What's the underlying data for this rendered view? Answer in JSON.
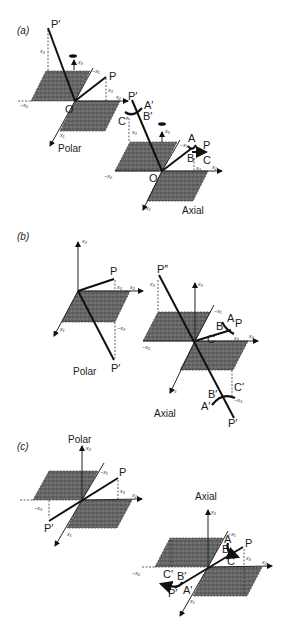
{
  "figure": {
    "panels": [
      {
        "id": "a",
        "label": "(a)",
        "polar": {
          "caption": "Polar",
          "origin": "O",
          "points": [
            "P",
            "P′"
          ],
          "axes": [
            "x1",
            "x2",
            "x3",
            "−x1",
            "−x2"
          ],
          "coord_labels": [
            "x3",
            "x3"
          ]
        },
        "axial": {
          "caption": "Axial",
          "origin": "O",
          "points": [
            "P",
            "P′",
            "A",
            "B",
            "C",
            "A′",
            "B′",
            "C′"
          ],
          "axes": [
            "x1",
            "x2",
            "x3",
            "−x1",
            "−x2"
          ],
          "coord_labels": [
            "x3",
            "x3"
          ]
        }
      },
      {
        "id": "b",
        "label": "(b)",
        "polar": {
          "caption": "Polar",
          "points": [
            "P",
            "P′"
          ],
          "axes": [
            "x1",
            "x2",
            "x3"
          ],
          "coord_labels": [
            "x3",
            "−x3"
          ]
        },
        "axial": {
          "caption": "Axial",
          "points": [
            "P",
            "P′",
            "P″",
            "A",
            "B",
            "C",
            "A′",
            "B′",
            "C′"
          ],
          "axes": [
            "x1",
            "x2",
            "x3",
            "−x1",
            "−x2"
          ],
          "coord_labels": [
            "x3",
            "x3",
            "−x3"
          ]
        }
      },
      {
        "id": "c",
        "label": "(c)",
        "polar": {
          "caption": "Polar",
          "points": [
            "P",
            "P′"
          ],
          "axes": [
            "x1",
            "x2",
            "x3",
            "−x1"
          ],
          "coord_labels": [
            "x3",
            "−x3"
          ]
        },
        "axial": {
          "caption": "Axial",
          "points": [
            "P",
            "P′",
            "A",
            "B",
            "C",
            "A′",
            "B′",
            "C′"
          ],
          "axes": [
            "x1",
            "x2",
            "x3",
            "−x1",
            "−x2"
          ],
          "coord_labels": [
            "x3"
          ]
        }
      }
    ],
    "text": {
      "a_label": "(a)",
      "b_label": "(b)",
      "c_label": "(c)",
      "polar": "Polar",
      "axial": "Axial",
      "O": "O",
      "P": "P",
      "Pp": "P′",
      "Ppp": "P″",
      "A": "A",
      "B": "B",
      "C": "C",
      "Ap": "A′",
      "Bp": "B′",
      "Cp": "C′",
      "x1": "x₁",
      "x2": "x₂",
      "x3": "x₃",
      "mx1": "−x₁",
      "mx2": "−x₂",
      "mx3": "−x₃"
    },
    "colors": {
      "ink": "#111111",
      "plane": "#555555",
      "background": "#ffffff"
    }
  }
}
